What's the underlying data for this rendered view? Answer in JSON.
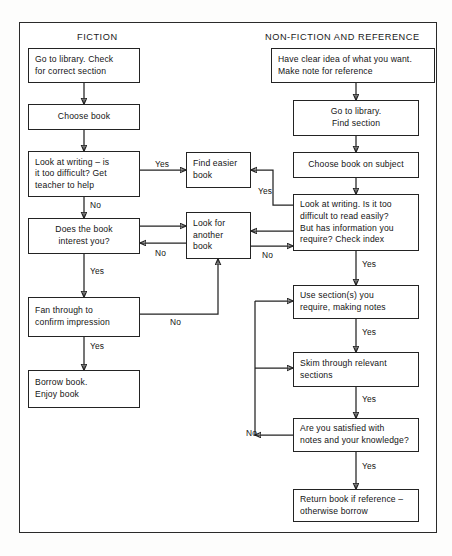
{
  "figure": {
    "type": "flowchart",
    "orientation": "two-column",
    "frame_border": "#2a2a2a",
    "background": "#ffffff"
  },
  "columns": [
    {
      "id": "fiction",
      "title": "FICTION"
    },
    {
      "id": "non_fiction",
      "title": "NON-FICTION AND REFERENCE"
    }
  ],
  "nodes": {
    "go_to_library_check": "Go to library. Check\nfor correct section",
    "choose_book": "Choose book",
    "look_at_writing_fiction": "Look at writing – is\nit too difficult? Get\nteacher to help",
    "does_book_interest": "Does the book\ninterest you?",
    "fan_through": "Fan through to\nconfirm impression",
    "borrow_book": "Borrow book.\nEnjoy book",
    "find_easier_book": "Find easier\nbook",
    "look_for_another_book": "Look for\nanother\nbook",
    "have_clear_idea": "Have clear idea of what you want.\nMake note for reference",
    "go_to_library_find": "Go to library.\nFind section",
    "choose_book_on_subject": "Choose book on subject",
    "look_at_writing_nonfiction": "Look at writing. Is it too\ndifficult to read easily?\nBut has information you\nrequire? Check index",
    "use_sections": "Use section(s) you\nrequire, making notes",
    "skim_through": "Skim through relevant\nsections",
    "are_you_satisfied": "Are you satisfied with\nnotes and your knowledge?",
    "return_book": "Return book if reference –\notherwise borrow"
  },
  "edge_labels": {
    "fiction_writing_yes": "Yes",
    "fiction_writing_no": "No",
    "interest_yes": "Yes",
    "interest_no": "No",
    "fan_no": "No",
    "nonfiction_writing_yes": "Yes",
    "nonfiction_writing_no": "No",
    "nonfiction_index_yes": "Yes",
    "use_sections_yes": "Yes",
    "skim_yes": "Yes",
    "satisfied_no": "No",
    "satisfied_yes": "Yes"
  }
}
